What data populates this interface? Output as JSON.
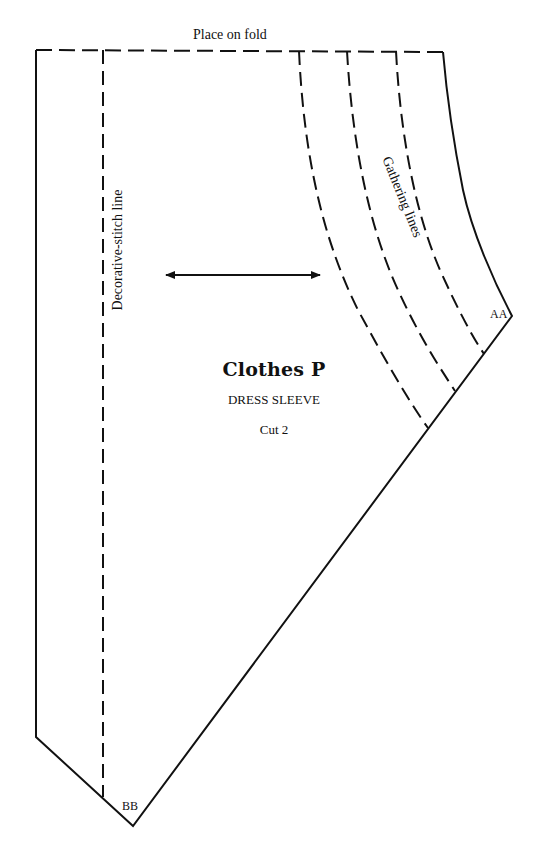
{
  "pattern": {
    "fold_label": "Place on fold",
    "stitch_line_label": "Decorative-stitch line",
    "gathering_label": "Gathering lines",
    "notch_top": "AA",
    "notch_bottom": "BB",
    "brand": "Clothes P",
    "piece_name": "DRESS SLEEVE",
    "cut_instruction": "Cut 2",
    "grainline": "double-headed-arrow",
    "line_color": "#111111",
    "background": "#ffffff"
  }
}
